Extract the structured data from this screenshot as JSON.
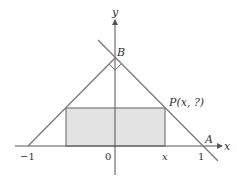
{
  "diagram": {
    "type": "coordinate-geometry",
    "axes": {
      "x_label": "x",
      "y_label": "y"
    },
    "ticks": {
      "neg_one": "−1",
      "origin": "0",
      "x_var": "x",
      "one": "1"
    },
    "points": {
      "B": "B",
      "A": "A",
      "P": "P(x, ?)"
    },
    "colors": {
      "line": "#7a7a7a",
      "axis": "#555555",
      "fill": "#e3e3e3",
      "text": "#333333"
    }
  }
}
